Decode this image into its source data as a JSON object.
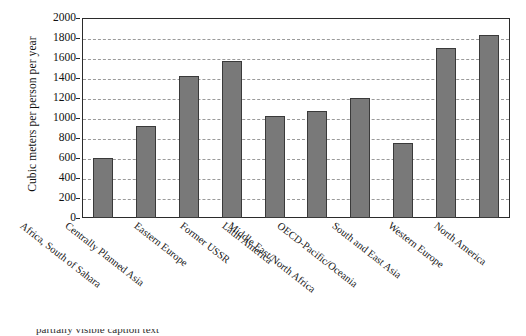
{
  "chart_data": {
    "type": "bar",
    "title": "",
    "xlabel": "",
    "ylabel": "Cubic meters per person per year",
    "ylim": [
      0,
      2000
    ],
    "ytick_step": 200,
    "yticks": [
      "2000",
      "1800",
      "1600",
      "1400",
      "1200",
      "1000",
      "800",
      "600",
      "400",
      "200",
      "0"
    ],
    "grid": "horizontal-dashed",
    "legend": "none",
    "bar_color": "#797979",
    "bar_edge_color": "#3a3a3a",
    "axis_color": "#2b2b2b",
    "gridline_color": "#9a9a9a",
    "categories": [
      "Africa, South of Sahara",
      "Centrally Planned Asia",
      "Eastern Europe",
      "Former USSR",
      "Latin America",
      "Middle East/North Africa",
      "OECD-Pacific/Oceania",
      "South and East Asia",
      "Western Europe",
      "North America"
    ],
    "values": [
      600,
      920,
      1420,
      1570,
      1020,
      1070,
      1200,
      750,
      1700,
      1830
    ]
  },
  "caption": {
    "cropped_line": "partially visible caption text"
  }
}
